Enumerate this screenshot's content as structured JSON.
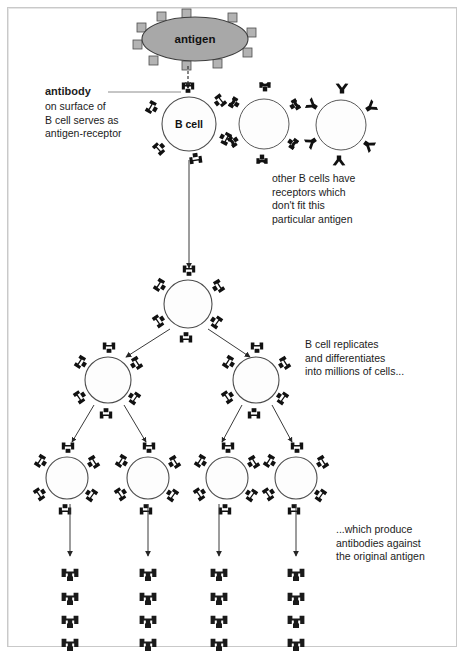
{
  "diagram": {
    "background_color": "#ffffff",
    "border_color": "#c9c9c9",
    "ink_color": "#1a1a1a",
    "antigen_fill": "#a8a8a8",
    "cell_fill": "#fdfdfd",
    "receptor_color": "#111111"
  },
  "antigen": {
    "label": "antigen",
    "epitope_count": 10,
    "shape": "ellipse"
  },
  "cells": {
    "primary_label": "B cell",
    "matching_receptor": "forked-antibody-receptor",
    "nonmatching_receptors": [
      "crescent-receptor",
      "y-receptor"
    ],
    "generation_counts": [
      1,
      1,
      2,
      4
    ]
  },
  "labels": {
    "antibody_title": "antibody",
    "antibody_body": "on surface of\nB cell serves as\nantigen-receptor",
    "other_cells": "other B cells have\nreceptors which\ndon't fit this\nparticular antigen",
    "replication": "B cell replicates\nand differentiates\ninto millions of cells...",
    "production": "...which produce\nantibodies against\nthe original antigen"
  },
  "antibody_output": {
    "columns": 4,
    "per_column": 4,
    "glyph": "antibody-glyph"
  }
}
